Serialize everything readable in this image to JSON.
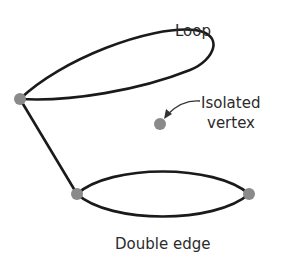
{
  "diagram": {
    "type": "graph",
    "labels": {
      "loop": "Loop",
      "isolated_line1": "Isolated",
      "isolated_line2": "vertex",
      "double_edge": "Double edge"
    },
    "vertices": [
      {
        "id": "A",
        "x": 20,
        "y": 99,
        "description": "vertex with loop"
      },
      {
        "id": "B",
        "x": 77,
        "y": 194,
        "description": "left endpoint of double edge"
      },
      {
        "id": "C",
        "x": 249,
        "y": 194,
        "description": "right endpoint of double edge"
      },
      {
        "id": "D",
        "x": 160,
        "y": 124,
        "description": "isolated vertex"
      }
    ],
    "edges": [
      {
        "from": "A",
        "to": "A",
        "kind": "loop"
      },
      {
        "from": "A",
        "to": "B",
        "kind": "simple"
      },
      {
        "from": "B",
        "to": "C",
        "kind": "double",
        "multiplicity": 2
      }
    ],
    "colors": {
      "edge": "#1a1a1a",
      "vertex": "#8a8a8a",
      "text": "#2b2b2b",
      "background": "#ffffff"
    }
  }
}
